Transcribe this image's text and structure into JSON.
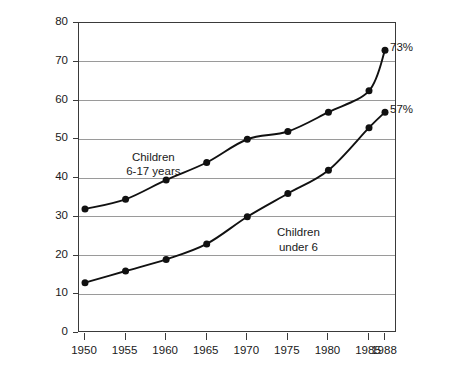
{
  "chart_data": {
    "type": "line",
    "title": "",
    "xlabel": "",
    "ylabel": "",
    "grid": "horizontal",
    "legend": "inline-annotations",
    "x": [
      1950,
      1955,
      1960,
      1965,
      1970,
      1975,
      1980,
      1985,
      1988
    ],
    "xticklabels": [
      "1950",
      "1955",
      "1960",
      "1965",
      "1970",
      "1975",
      "1980",
      "1985",
      "1988"
    ],
    "yticklabels": [
      "0",
      "10",
      "20",
      "30",
      "40",
      "50",
      "60",
      "70",
      "80"
    ],
    "ylim": [
      0,
      80
    ],
    "ytick_step": 10,
    "series": [
      {
        "name": "Children 6-17 years",
        "annotation": "Children\n6-17 years",
        "annotation_line1": "Children",
        "annotation_line2": "6-17 years",
        "end_label": "73%",
        "values": [
          32,
          34.5,
          39.5,
          44,
          50,
          52,
          57,
          62.5,
          73
        ],
        "marker": "filled-circle",
        "color": "#111111"
      },
      {
        "name": "Children under 6",
        "annotation": "Children\nunder 6",
        "annotation_line1": "Children",
        "annotation_line2": "under 6",
        "end_label": "57%",
        "values": [
          13,
          16,
          19,
          23,
          30,
          36,
          42,
          53,
          57
        ],
        "marker": "filled-circle",
        "color": "#111111"
      }
    ],
    "gridline_color": "#9a9a9a",
    "axis_color": "#3a3a3a",
    "background": "#ffffff"
  }
}
